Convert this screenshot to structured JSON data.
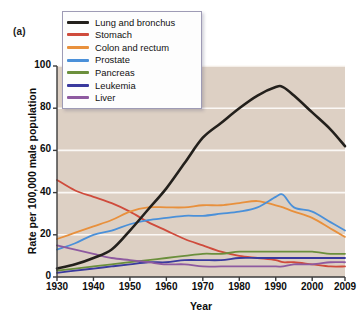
{
  "panel": {
    "label": "(a)"
  },
  "colors": {
    "plot_background": "#ddd0c4",
    "gridline": "#fbf8f5",
    "axis": "#3b3b3b",
    "legend_border": "#9e9bb5",
    "page_background": "#ffffff"
  },
  "legend": {
    "position": "top-left-inside",
    "items": [
      {
        "label": "Lung and bronchus",
        "color": "#23201c"
      },
      {
        "label": "Stomach",
        "color": "#cf4b3c"
      },
      {
        "label": "Colon and rectum",
        "color": "#e8903c"
      },
      {
        "label": "Prostate",
        "color": "#4a90d9"
      },
      {
        "label": "Pancreas",
        "color": "#6b8f3c"
      },
      {
        "label": "Leukemia",
        "color": "#3a3a9e"
      },
      {
        "label": "Liver",
        "color": "#8e5aa0"
      }
    ]
  },
  "chart_data": {
    "type": "line",
    "title": "",
    "subtitle": "",
    "xlabel": "Year",
    "ylabel": "Rate per 100,000 male population",
    "xlim": [
      1930,
      2009
    ],
    "ylim": [
      0,
      100
    ],
    "grid": true,
    "xticks": [
      1930,
      1940,
      1950,
      1960,
      1970,
      1980,
      1990,
      2000,
      2009
    ],
    "xtick_labels": [
      "1930",
      "1940",
      "1950",
      "1960",
      "1970",
      "1980",
      "1990",
      "2000",
      "2009"
    ],
    "yticks": [
      0,
      20,
      40,
      60,
      80,
      100
    ],
    "ytick_labels": [
      "0",
      "20",
      "40",
      "60",
      "80",
      "100"
    ],
    "x": [
      1930,
      1935,
      1940,
      1945,
      1950,
      1955,
      1960,
      1965,
      1970,
      1975,
      1980,
      1985,
      1990,
      1992,
      1995,
      2000,
      2005,
      2009
    ],
    "series": [
      {
        "name": "Lung and bronchus",
        "color": "#23201c",
        "values": [
          4,
          6,
          9,
          13,
          22,
          32,
          42,
          54,
          66,
          73,
          80,
          86,
          90,
          90,
          86,
          78,
          70,
          62
        ]
      },
      {
        "name": "Stomach",
        "color": "#cf4b3c",
        "values": [
          46,
          41,
          38,
          35,
          31,
          26,
          22,
          18,
          15,
          12,
          10,
          9,
          8,
          7,
          7,
          6,
          5,
          5
        ]
      },
      {
        "name": "Colon and rectum",
        "color": "#e8903c",
        "values": [
          18,
          21,
          24,
          27,
          31,
          33,
          33,
          33,
          34,
          34,
          35,
          36,
          34,
          33,
          31,
          28,
          23,
          19
        ]
      },
      {
        "name": "Prostate",
        "color": "#4a90d9",
        "values": [
          13,
          16,
          20,
          22,
          25,
          27,
          28,
          29,
          29,
          30,
          31,
          33,
          38,
          39,
          33,
          31,
          26,
          22
        ]
      },
      {
        "name": "Pancreas",
        "color": "#6b8f3c",
        "values": [
          3,
          4,
          5,
          6,
          7,
          8,
          9,
          10,
          11,
          11,
          12,
          12,
          12,
          12,
          12,
          12,
          11,
          11
        ]
      },
      {
        "name": "Leukemia",
        "color": "#3a3a9e",
        "values": [
          2,
          3,
          4,
          5,
          6,
          7,
          7,
          8,
          8,
          8,
          9,
          9,
          9,
          9,
          9,
          9,
          9,
          9
        ]
      },
      {
        "name": "Liver",
        "color": "#8e5aa0",
        "values": [
          15,
          13,
          11,
          9,
          8,
          7,
          6,
          6,
          5,
          5,
          5,
          5,
          5,
          5,
          6,
          6,
          7,
          7
        ]
      }
    ]
  }
}
